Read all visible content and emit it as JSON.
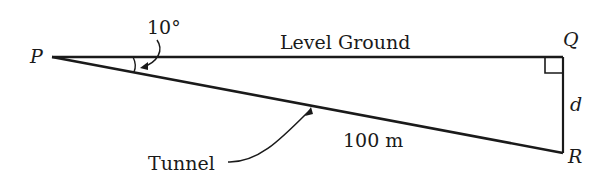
{
  "diagram": {
    "points": {
      "P": "P",
      "Q": "Q",
      "R": "R"
    },
    "labels": {
      "level_ground": "Level Ground",
      "tunnel": "Tunnel",
      "hypotenuse_length": "100 m",
      "angle": "10°",
      "side_d": "d"
    },
    "colors": {
      "line": "#1a1a1a",
      "background": "#ffffff"
    }
  }
}
